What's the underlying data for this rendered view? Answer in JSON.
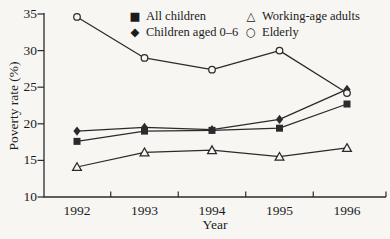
{
  "figure": {
    "background_color": "#f7f6f3",
    "line_color": "#2b2b2b",
    "text_color": "#1b1b1b"
  },
  "chart_data": {
    "type": "line",
    "title": "",
    "xlabel": "Year",
    "ylabel": "Poverty rate (%)",
    "x": [
      1992,
      1993,
      1994,
      1995,
      1996
    ],
    "ylim": [
      10,
      35
    ],
    "yticks": [
      10,
      15,
      20,
      25,
      30,
      35
    ],
    "grid": false,
    "legend_position": "top-inside, two columns",
    "series": [
      {
        "name": "All children",
        "marker": "filled-square",
        "values": [
          17.6,
          19.0,
          19.1,
          19.4,
          22.7
        ]
      },
      {
        "name": "Children aged 0–6",
        "marker": "filled-diamond",
        "values": [
          19.0,
          19.5,
          19.2,
          20.6,
          24.7
        ]
      },
      {
        "name": "Working-age adults",
        "marker": "open-triangle",
        "values": [
          14.1,
          16.1,
          16.4,
          15.5,
          16.7
        ]
      },
      {
        "name": "Elderly",
        "marker": "open-circle",
        "values": [
          34.6,
          29.0,
          27.4,
          30.0,
          24.2
        ]
      }
    ]
  }
}
